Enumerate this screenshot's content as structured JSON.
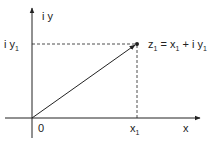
{
  "diagram": {
    "axes": {
      "x_label": "x",
      "y_label": "i y",
      "origin_label": "0"
    },
    "point": {
      "label_main": "z",
      "label_sub": "1",
      "label_eq": " = x",
      "label_eq_sub": "1",
      "label_plus": " + i y",
      "label_plus_sub": "1"
    },
    "projections": {
      "x_tick_main": "x",
      "x_tick_sub": "1",
      "y_tick_main": "i y",
      "y_tick_sub": "1"
    },
    "colors": {
      "stroke": "#222222",
      "background": "#ffffff"
    }
  }
}
